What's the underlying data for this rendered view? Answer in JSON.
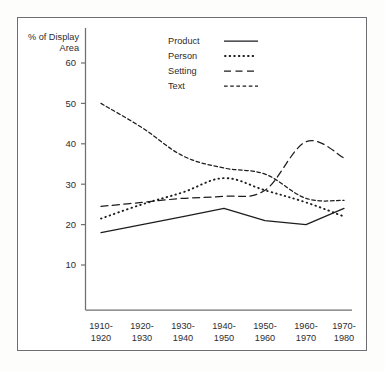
{
  "chart_data": {
    "type": "line",
    "title": "",
    "xlabel": "",
    "ylabel": "% of Display Area",
    "ylabel_line1": "% of Display",
    "ylabel_line2": "Area",
    "grid": false,
    "legend_position": "top-center",
    "ylim": [
      0,
      65
    ],
    "yticks": [
      10,
      20,
      30,
      40,
      50,
      60
    ],
    "ytick_labels": [
      "10",
      "20",
      "30",
      "40",
      "50",
      "60"
    ],
    "categories": [
      "1910-\n1920",
      "1920-\n1930",
      "1930-\n1940",
      "1940-\n1950",
      "1950-\n1960",
      "1960-\n1970",
      "1970-\n1980"
    ],
    "category_lines": [
      [
        "1910-",
        "1920"
      ],
      [
        "1920-",
        "1930"
      ],
      [
        "1930-",
        "1940"
      ],
      [
        "1940-",
        "1950"
      ],
      [
        "1950-",
        "1960"
      ],
      [
        "1960-",
        "1970"
      ],
      [
        "1970-",
        "1980"
      ]
    ],
    "series": [
      {
        "name": "Product",
        "style": "solid",
        "values": [
          18,
          20,
          22,
          24,
          21,
          20,
          24
        ]
      },
      {
        "name": "Person",
        "style": "dotted",
        "values": [
          21.5,
          25,
          28,
          31.5,
          28.5,
          25.5,
          22
        ]
      },
      {
        "name": "Setting",
        "style": "long-dash",
        "values": [
          24.5,
          25.5,
          26.5,
          27,
          28.5,
          40.5,
          36.5
        ]
      },
      {
        "name": "Text",
        "style": "short-dash",
        "values": [
          50,
          44,
          37,
          34,
          32.5,
          26.5,
          26
        ]
      }
    ],
    "colors": {
      "line": "#1d1d20",
      "axis": "#6f6f73",
      "frame": "#6e6e72",
      "background": "#ffffff",
      "text": "#2d2d30"
    }
  },
  "legend": {
    "entries": [
      {
        "label": "Product",
        "style": "solid"
      },
      {
        "label": "Person",
        "style": "dotted"
      },
      {
        "label": "Setting",
        "style": "long-dash"
      },
      {
        "label": "Text",
        "style": "short-dash"
      }
    ]
  }
}
